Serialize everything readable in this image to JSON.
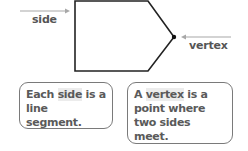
{
  "diagram": {
    "shape": "pentagon",
    "labels": {
      "side": "side",
      "vertex": "vertex"
    },
    "callouts": {
      "side_box": {
        "pre": "Each ",
        "highlight": "side",
        "post": " is a line segment."
      },
      "vertex_box": {
        "pre": "A ",
        "highlight": "vertex",
        "post": " is a point where two sides meet."
      }
    },
    "colors": {
      "shape_stroke": "#222222",
      "arrow": "#a0a0a0",
      "text": "#555555",
      "box_border": "#7a7a7a",
      "highlight": "#ececec"
    }
  }
}
